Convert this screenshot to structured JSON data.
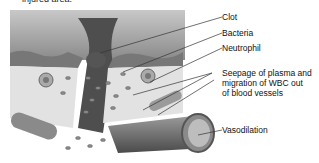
{
  "caption": "injured area.",
  "labels": {
    "clot": "Clot",
    "bacteria": "Bacteria",
    "neutrophil": "Neutrophil",
    "seepage_line1": "Seepage of plasma and",
    "seepage_line2": "migration of WBC out",
    "seepage_line3": "of blood vessels",
    "vasodilation": "Vasodilation"
  },
  "colors": {
    "background": "#ffffff",
    "tissue_dark": "#6e6e6e",
    "tissue_light": "#d9d9d9",
    "line": "#333333"
  }
}
